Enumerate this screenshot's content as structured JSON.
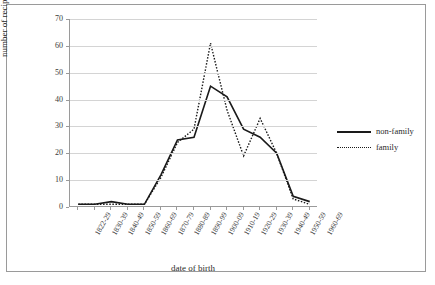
{
  "chart_data": {
    "type": "line",
    "title": "",
    "xlabel": "date of birth",
    "ylabel": "number of recipients",
    "categories": [
      "1822-29",
      "1830-39",
      "1840-49",
      "1850-59",
      "1860-69",
      "1870-79",
      "1880-89",
      "1890-99",
      "1900-09",
      "1910-19",
      "1920-29",
      "1930-39",
      "1940-49",
      "1950-59",
      "1960-69"
    ],
    "ylim": [
      0,
      70
    ],
    "yticks": [
      0,
      10,
      20,
      30,
      40,
      50,
      60,
      70
    ],
    "grid": true,
    "legend_position": "right",
    "series": [
      {
        "name": "non-family",
        "style": "solid",
        "color": "#1a1a1a",
        "values": [
          1,
          1,
          2,
          1,
          1,
          12,
          25,
          26,
          45,
          41,
          29,
          26,
          20,
          4,
          2
        ]
      },
      {
        "name": "family",
        "style": "dotted",
        "color": "#1a1a1a",
        "values": [
          1,
          1,
          1,
          1,
          1,
          11,
          24,
          29,
          61,
          36,
          19,
          33,
          20,
          3,
          1
        ]
      }
    ]
  },
  "legend": {
    "items": [
      {
        "label": "non-family",
        "style": "solid"
      },
      {
        "label": "family",
        "style": "dotted"
      }
    ]
  }
}
